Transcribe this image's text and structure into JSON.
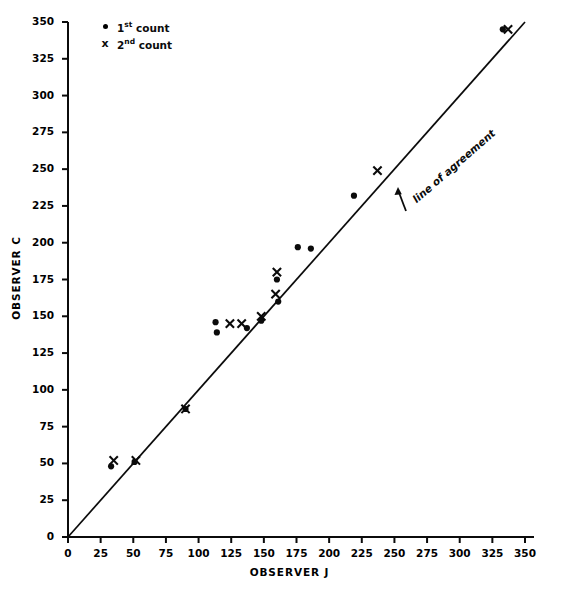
{
  "chart_data": {
    "type": "scatter",
    "title": "",
    "xlabel": "OBSERVER J",
    "ylabel": "OBSERVER C",
    "xlim": [
      0,
      350
    ],
    "ylim": [
      0,
      350
    ],
    "xticks": [
      0,
      25,
      50,
      75,
      100,
      125,
      150,
      175,
      200,
      225,
      250,
      275,
      300,
      325,
      350
    ],
    "yticks": [
      0,
      25,
      50,
      75,
      100,
      125,
      150,
      175,
      200,
      225,
      250,
      275,
      300,
      325,
      350
    ],
    "grid": false,
    "legend_position": "upper left",
    "series": [
      {
        "name": "1st count",
        "marker": "dot",
        "points": [
          [
            33,
            48
          ],
          [
            51,
            51
          ],
          [
            90,
            87
          ],
          [
            113,
            146
          ],
          [
            114,
            139
          ],
          [
            137,
            142
          ],
          [
            148,
            147
          ],
          [
            160,
            175
          ],
          [
            161,
            160
          ],
          [
            176,
            197
          ],
          [
            186,
            196
          ],
          [
            219,
            232
          ],
          [
            333,
            345
          ]
        ]
      },
      {
        "name": "2nd count",
        "marker": "x",
        "points": [
          [
            35,
            52
          ],
          [
            52,
            52
          ],
          [
            90,
            87
          ],
          [
            124,
            145
          ],
          [
            133,
            145
          ],
          [
            148,
            150
          ],
          [
            159,
            165
          ],
          [
            160,
            180
          ],
          [
            237,
            249
          ],
          [
            337,
            345
          ]
        ]
      }
    ],
    "reference_line": {
      "label": "line of agreement",
      "from": [
        0,
        0
      ],
      "to": [
        350,
        350
      ]
    }
  },
  "legend": {
    "items": [
      {
        "marker": "dot-marker",
        "prefix": "1",
        "superscript": "st",
        "suffix": "count"
      },
      {
        "marker": "x-marker",
        "prefix": "2",
        "superscript": "nd",
        "suffix": "count"
      }
    ]
  },
  "annotation": {
    "line_of_agreement": "line of agreement"
  },
  "colors": {
    "ink": "#0b0b0b",
    "background": "#ffffff"
  }
}
